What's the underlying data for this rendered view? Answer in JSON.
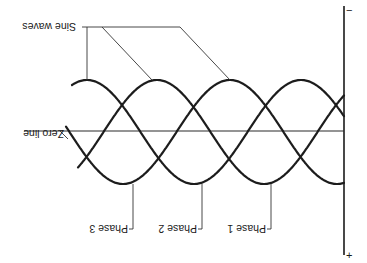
{
  "diagram": {
    "orientation": "rotated 180 degrees",
    "labels": {
      "sine_waves": "Sine waves",
      "zero_line": "Zero line",
      "phase1": "Phase 1",
      "phase2": "Phase 2",
      "phase3": "Phase 3",
      "axis_top": "−",
      "axis_bottom": "+"
    },
    "geometry": {
      "axis_x": 344,
      "axis_top_y": 6,
      "axis_bottom_y": 255,
      "zero_y": 131,
      "zero_left_x": 24,
      "center_y": 132,
      "amplitude": 52,
      "period": 214
    },
    "phases": [
      {
        "name": "Phase 1",
        "peak_x": 157,
        "start_x": 78,
        "trough_leader_x": 271
      },
      {
        "name": "Phase 2",
        "peak_x": 87,
        "start_x": 72,
        "trough_leader_x": 200
      },
      {
        "name": "Phase 3",
        "peak_x": 230,
        "start_x": 66,
        "trough_leader_x": 130
      }
    ],
    "colors": {
      "line": "#1c1c1c",
      "background": "#ffffff"
    }
  }
}
